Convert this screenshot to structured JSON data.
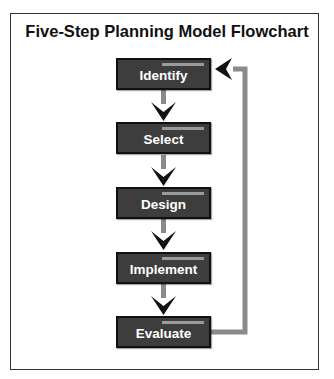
{
  "title": "Five-Step Planning Model Flowchart",
  "steps": [
    {
      "label": "Identify"
    },
    {
      "label": "Select"
    },
    {
      "label": "Design"
    },
    {
      "label": "Implement"
    },
    {
      "label": "Evaluate"
    }
  ],
  "colors": {
    "box_fill": "#3d3d3d",
    "box_border": "#111111",
    "box_text": "#ffffff",
    "box_highlight": "#9a9a9a",
    "connector": "#8a8a8a",
    "arrowhead": "#111111"
  },
  "feedback_loop": {
    "from": "Evaluate",
    "to": "Identify"
  }
}
